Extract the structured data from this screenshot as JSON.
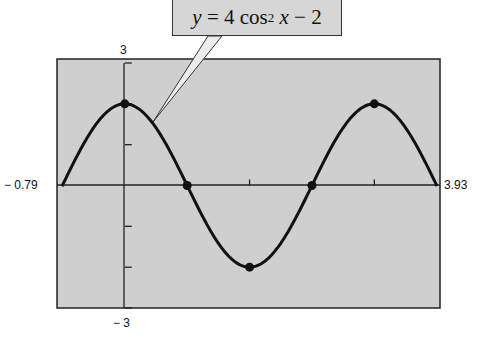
{
  "chart_data": {
    "type": "line",
    "function": "y = 4cos^2(x) - 2",
    "xlabel": "",
    "ylabel": "",
    "xlim": [
      -0.79,
      3.93
    ],
    "ylim": [
      -3,
      3
    ],
    "grid": false,
    "legend": "none",
    "x_ticks": [
      1.5708,
      3.1416
    ],
    "y_ticks": [
      -2,
      -1,
      1,
      2
    ],
    "axis_end_labels": {
      "xmin": "− 0.79",
      "xmax": "3.93",
      "ymax": "3",
      "ymin": "− 3"
    },
    "marked_points": [
      {
        "x": 0,
        "y": 2,
        "kind": "maximum"
      },
      {
        "x": 0.7854,
        "y": 0,
        "kind": "zero"
      },
      {
        "x": 1.5708,
        "y": -2,
        "kind": "minimum"
      },
      {
        "x": 2.3562,
        "y": 0,
        "kind": "zero"
      },
      {
        "x": 3.1416,
        "y": 2,
        "kind": "maximum"
      }
    ],
    "series": [
      {
        "name": "y = 4 cos² x − 2",
        "x": [
          -0.79,
          -0.5,
          -0.25,
          0,
          0.25,
          0.5,
          0.7854,
          1.0,
          1.25,
          1.5708,
          1.85,
          2.1,
          2.3562,
          2.6,
          2.9,
          3.1416,
          3.4,
          3.7,
          3.93
        ],
        "values": [
          -0.02,
          1.08,
          1.76,
          2.0,
          1.76,
          1.08,
          0.0,
          -0.83,
          -1.6,
          -2.0,
          -1.6,
          -1.0,
          0.0,
          0.93,
          1.77,
          2.0,
          1.74,
          0.96,
          -0.02
        ]
      }
    ],
    "annotations": [
      {
        "text": "y = 4 cos² x − 2",
        "points_to": "curve near x≈0.4"
      }
    ]
  },
  "labels": {
    "xmin": "− 0.79",
    "xmax": "3.93",
    "ymax": "3",
    "ymin": "− 3"
  },
  "equation": {
    "lhs": "y",
    "eq": " = 4 cos",
    "exp": "2",
    "var": " x",
    "rest": " − 2"
  },
  "colors": {
    "plot_bg": "#cfcfcf",
    "curve": "#111111",
    "axis": "#222222"
  }
}
